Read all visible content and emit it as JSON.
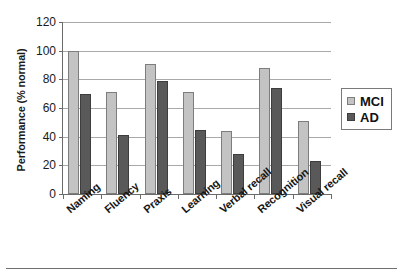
{
  "chart_data": {
    "type": "bar",
    "title": "",
    "subtitle": "",
    "xlabel": "",
    "ylabel": "Performance (% normal)",
    "ylim": [
      0,
      120
    ],
    "ytick_step": 20,
    "yticks": [
      "0",
      "20",
      "40",
      "60",
      "80",
      "100",
      "120"
    ],
    "grid": true,
    "legend_position": "right",
    "categories": [
      "Naming",
      "Fluency",
      "Praxis",
      "Learning",
      "Verbal recall",
      "Recognition",
      "Visual recall"
    ],
    "series": [
      {
        "name": "MCI",
        "color": "#c3c3c3",
        "values": [
          100,
          71,
          91,
          71,
          44,
          88,
          51
        ]
      },
      {
        "name": "AD",
        "color": "#595959",
        "values": [
          70,
          41,
          79,
          45,
          28,
          74,
          23
        ]
      }
    ]
  },
  "legend": {
    "entries": [
      {
        "label": "MCI",
        "swatch": "light-gray-swatch"
      },
      {
        "label": "AD",
        "swatch": "dark-gray-swatch"
      }
    ]
  },
  "colors": {
    "mci": "#c3c3c3",
    "ad": "#595959",
    "axis": "#6b6b6b",
    "gridline": "#a9a9a9",
    "text": "#1a1a1a"
  }
}
